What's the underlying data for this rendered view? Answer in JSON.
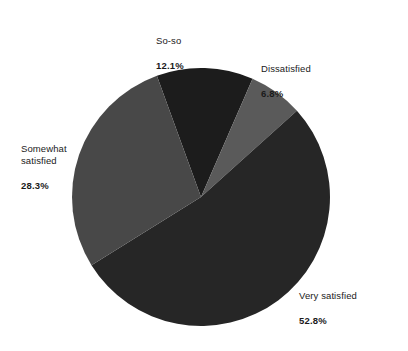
{
  "chart_data": {
    "type": "pie",
    "title": "",
    "subtitle": "",
    "xlabel": "",
    "ylabel": "",
    "legend_position": "none",
    "grid": false,
    "labels_outside": true,
    "categories": [
      "So-so",
      "Dissatisfied",
      "Very satisfied",
      "Somewhat satisfied"
    ],
    "values": [
      12.1,
      6.8,
      52.8,
      28.3
    ],
    "value_unit": "%",
    "start_angle_deg": -20,
    "direction": "clockwise",
    "slices": [
      {
        "label": "So-so",
        "value": 12.1,
        "value_text": "12.1%",
        "color": "#1c1c1c",
        "label_x": 156,
        "label_y": 22
      },
      {
        "label": "Dissatisfied",
        "value": 6.8,
        "value_text": "6.8%",
        "color": "#5a5a5a",
        "label_x": 261,
        "label_y": 50
      },
      {
        "label": "Very satisfied",
        "value": 52.8,
        "value_text": "52.8%",
        "color": "#262626",
        "label_x": 299,
        "label_y": 277
      },
      {
        "label": "Somewhat\nsatisfied",
        "value": 28.3,
        "value_text": "28.3%",
        "color": "#484848",
        "label_x": 21,
        "label_y": 130
      }
    ],
    "geometry": {
      "center_x": 201,
      "center_y": 197,
      "radius": 129
    },
    "background_color": "#ffffff",
    "text_color": "#1a1a1a"
  }
}
